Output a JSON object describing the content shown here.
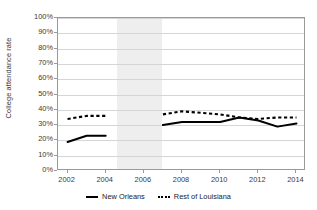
{
  "chart_data": {
    "type": "line",
    "title": "",
    "xlabel": "",
    "ylabel": "College attendance rate",
    "ylim": [
      0,
      100
    ],
    "xlim": [
      2001.5,
      2014.5
    ],
    "grid": true,
    "legend_position": "bottom-center",
    "y_tick_labels": [
      "100%",
      "90%",
      "80%",
      "70%",
      "60%",
      "50%",
      "40%",
      "30%",
      "20%",
      "10%",
      "0%"
    ],
    "y_tick_values": [
      100,
      90,
      80,
      70,
      60,
      50,
      40,
      30,
      20,
      10,
      0
    ],
    "x_tick_labels": [
      "2002",
      "2004",
      "2006",
      "2008",
      "2010",
      "2012",
      "2014"
    ],
    "x_tick_values": [
      2002,
      2004,
      2006,
      2008,
      2010,
      2012,
      2014
    ],
    "x": [
      2002,
      2003,
      2004,
      2005,
      2006,
      2007,
      2008,
      2009,
      2010,
      2011,
      2012,
      2013,
      2014
    ],
    "series": [
      {
        "name": "New Orleans",
        "style": "solid",
        "color": "#000000",
        "values": [
          19,
          23,
          23,
          null,
          null,
          30,
          32,
          32,
          32,
          35,
          33,
          29,
          31
        ]
      },
      {
        "name": "Rest of Louisiana",
        "style": "dashed",
        "color": "#000000",
        "values": [
          34,
          36,
          36,
          null,
          null,
          37,
          39,
          38,
          37,
          35,
          34,
          35,
          35
        ]
      }
    ],
    "shaded_bands": [
      {
        "label": "data-gap-band",
        "x_start": 2004.6,
        "x_end": 2006.95,
        "color": "#ebebeb"
      }
    ]
  },
  "legend": {
    "items": [
      {
        "label": "New Orleans",
        "style": "solid"
      },
      {
        "label": "Rest of Louisiana",
        "style": "dashed"
      }
    ]
  }
}
